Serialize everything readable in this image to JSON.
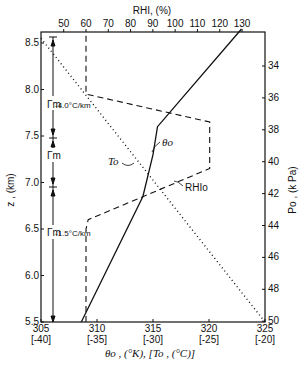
{
  "chart_data": {
    "type": "line",
    "title": "",
    "xlabel": "θo , (°K), [To , (°C)]",
    "x2label": "RHI, (%)",
    "ylabel": "z , (km)",
    "y2label": "Po , (k Pa)",
    "xlim": [
      305,
      325
    ],
    "x2lim": [
      39.6,
      140
    ],
    "ylim": [
      5.5,
      8.6
    ],
    "x_ticks": [
      "305",
      "310",
      "315",
      "320",
      "325"
    ],
    "x_ticks_secondary": [
      "[-40]",
      "[-35]",
      "[-30]",
      "[-25]",
      "[-20]"
    ],
    "x2_ticks": [
      "50",
      "60",
      "70",
      "80",
      "90",
      "100",
      "110",
      "120",
      "130"
    ],
    "y_ticks": [
      "5.5",
      "6.0",
      "6.5",
      "7.0",
      "7.5",
      "8.0",
      "8.5"
    ],
    "y2_ticks": [
      "34",
      "36",
      "38",
      "40",
      "42",
      "44",
      "46",
      "48",
      "50"
    ],
    "series": [
      {
        "name": "θo",
        "style": "solid",
        "axis": "bottom (K)",
        "points": [
          [
            308.6,
            5.5
          ],
          [
            314.1,
            6.85
          ],
          [
            315.0,
            7.3
          ],
          [
            315.4,
            7.6
          ],
          [
            322.9,
            8.65
          ]
        ]
      },
      {
        "name": "RHIo",
        "style": "dashed",
        "axis": "top (%)",
        "points": [
          [
            60,
            5.5
          ],
          [
            60,
            6.5
          ],
          [
            61,
            6.6
          ],
          [
            115.5,
            7.15
          ],
          [
            115.5,
            7.65
          ],
          [
            60,
            7.95
          ],
          [
            60,
            8.6
          ]
        ]
      },
      {
        "name": "To",
        "style": "dotted",
        "axis": "bottom [°C]",
        "points": [
          [
            -40,
            8.55
          ],
          [
            -20,
            5.5
          ]
        ]
      }
    ],
    "annotations": [
      {
        "text": "Γm-4.0°C/km",
        "z_range": [
          7.6,
          8.55
        ]
      },
      {
        "text": "Γm",
        "z_range": [
          7.05,
          7.6
        ]
      },
      {
        "text": "Γm-1.5°C/km",
        "z_range": [
          5.5,
          7.05
        ]
      },
      {
        "text": "θo",
        "label_for": "solid line"
      },
      {
        "text": "To",
        "label_for": "dotted line"
      },
      {
        "text": "RHIo",
        "label_for": "dashed line"
      }
    ],
    "grid": false,
    "legend": "inline labels"
  },
  "labels": {
    "top_axis": "RHI, (%)",
    "left_axis": "z , (km)",
    "right_axis": "Po , (k Pa)",
    "bottom_axis": "θo , (°K), [To , (°C)]",
    "theta": "θo",
    "to": "To",
    "rhi": "RHIo",
    "gamma1": "Γm",
    "gamma1_sub": "-4.0°C/km",
    "gamma2": "Γm",
    "gamma3": "Γm",
    "gamma3_sub": "-1.5°C/km"
  }
}
